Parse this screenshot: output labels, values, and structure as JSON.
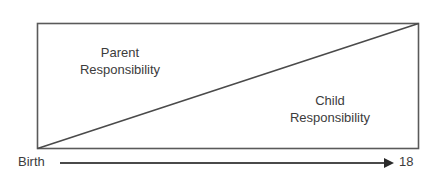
{
  "diagram": {
    "regions": [
      {
        "line1": "Parent",
        "line2": "Responsibility"
      },
      {
        "line1": "Child",
        "line2": "Responsibility"
      }
    ],
    "axis": {
      "start_label": "Birth",
      "end_label": "18"
    },
    "colors": {
      "line": "#555555",
      "text": "#3c3c3c",
      "background": "#ffffff"
    }
  }
}
